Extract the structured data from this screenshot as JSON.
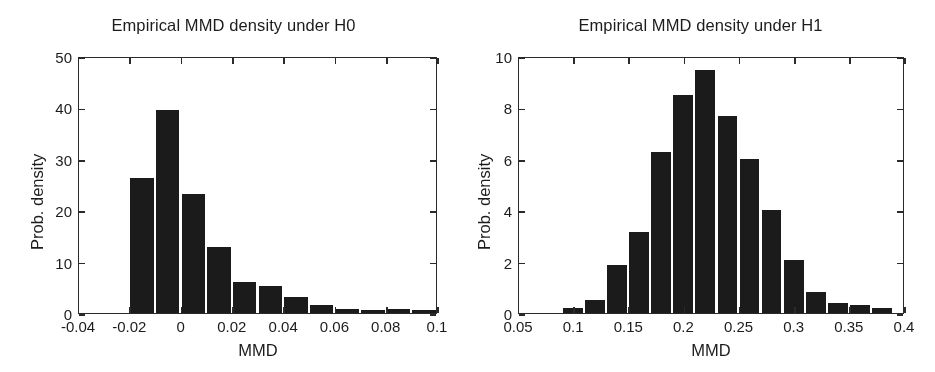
{
  "chart_data": [
    {
      "type": "bar",
      "id": "h0",
      "title": "Empirical MMD density under H0",
      "xlabel": "MMD",
      "ylabel": "Prob. density",
      "xlim": [
        -0.04,
        0.1
      ],
      "ylim": [
        0,
        50
      ],
      "grid": false,
      "legend": null,
      "xticks": [
        -0.04,
        -0.02,
        0,
        0.02,
        0.04,
        0.06,
        0.08,
        0.1
      ],
      "xtick_labels": [
        "-0.04",
        "-0.02",
        "0",
        "0.02",
        "0.04",
        "0.06",
        "0.08",
        "0.1"
      ],
      "yticks": [
        0,
        10,
        20,
        30,
        40,
        50
      ],
      "ytick_labels": [
        "0",
        "10",
        "20",
        "30",
        "40",
        "50"
      ],
      "bin_width": 0.01,
      "bin_edges": [
        -0.02,
        -0.01,
        0.0,
        0.01,
        0.02,
        0.03,
        0.04,
        0.05,
        0.06,
        0.07,
        0.08,
        0.09,
        0.1
      ],
      "values": [
        26.2,
        39.4,
        23.2,
        12.9,
        6.0,
        5.3,
        3.2,
        1.5,
        0.7,
        0.5,
        0.8,
        0.5
      ]
    },
    {
      "type": "bar",
      "id": "h1",
      "title": "Empirical MMD density under H1",
      "xlabel": "MMD",
      "ylabel": "Prob. density",
      "xlim": [
        0.05,
        0.4
      ],
      "ylim": [
        0,
        10
      ],
      "grid": false,
      "legend": null,
      "xticks": [
        0.05,
        0.1,
        0.15,
        0.2,
        0.25,
        0.3,
        0.35,
        0.4
      ],
      "xtick_labels": [
        "0.05",
        "0.1",
        "0.15",
        "0.2",
        "0.25",
        "0.3",
        "0.35",
        "0.4"
      ],
      "yticks": [
        0,
        2,
        4,
        6,
        8,
        10
      ],
      "ytick_labels": [
        "0",
        "2",
        "4",
        "6",
        "8",
        "10"
      ],
      "bin_width": 0.02,
      "bin_edges": [
        0.09,
        0.11,
        0.13,
        0.15,
        0.17,
        0.19,
        0.21,
        0.23,
        0.25,
        0.27,
        0.29,
        0.31,
        0.33,
        0.35,
        0.37,
        0.39
      ],
      "values": [
        0.2,
        0.5,
        1.85,
        3.15,
        6.25,
        8.5,
        9.45,
        7.65,
        6.0,
        4.0,
        2.05,
        0.8,
        0.4,
        0.3,
        0.2
      ]
    }
  ],
  "style": {
    "bar_color": "#1b1b1b",
    "axis_color": "#2a2a2a",
    "background": "#ffffff",
    "text_color": "#1c1c1c"
  }
}
